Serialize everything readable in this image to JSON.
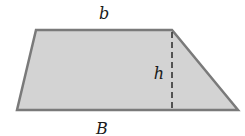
{
  "figure": {
    "shape": "trapezoid",
    "labels": {
      "top_base": "b",
      "bottom_base": "B",
      "height": "h"
    },
    "vertices": {
      "top_left": [
        36,
        30
      ],
      "top_right": [
        172,
        30
      ],
      "bottom_right": [
        238,
        110
      ],
      "bottom_left": [
        17,
        110
      ]
    },
    "height_line": {
      "x": 172,
      "y_top": 30,
      "y_bottom": 110,
      "style": "dashed"
    },
    "colors": {
      "fill": "#d3d3d3",
      "stroke": "#7a7a7a",
      "dash": "#333333",
      "text": "#1a1a1a",
      "background": "#ffffff"
    }
  }
}
